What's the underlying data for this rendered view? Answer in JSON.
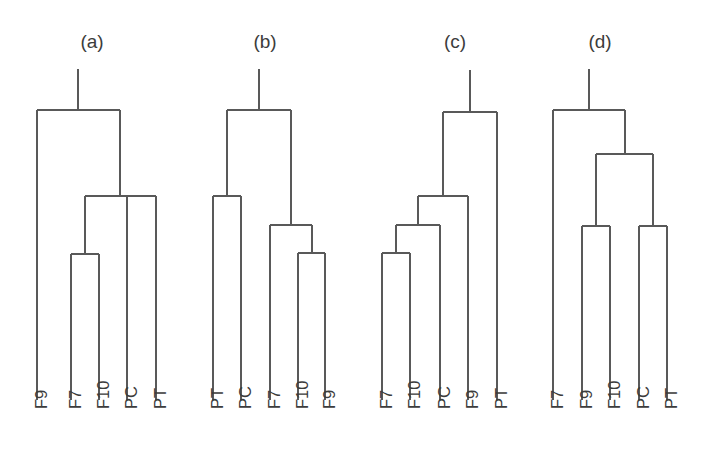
{
  "figure": {
    "background_color": "#ffffff",
    "line_color": "#595959",
    "text_color": "#3c3c3c",
    "width": 708,
    "height": 473
  },
  "panels": [
    {
      "id": "a",
      "title": "(a)",
      "title_x": 92,
      "title_y": 48,
      "leaves": [
        {
          "label": "F9",
          "x": 37
        },
        {
          "label": "F7",
          "x": 71
        },
        {
          "label": "F10",
          "x": 99
        },
        {
          "label": "PC",
          "x": 127
        },
        {
          "label": "PT",
          "x": 156
        }
      ],
      "merges": [
        {
          "name": "m1",
          "y": 254,
          "left": 71,
          "right": 99
        },
        {
          "name": "m2",
          "y": 196,
          "left": 85,
          "right": 156,
          "stubs": [
            127
          ]
        },
        {
          "name": "root",
          "y": 110,
          "left": 37,
          "right": 120
        }
      ],
      "root_stem": {
        "x": 78,
        "y_top": 69,
        "y_bottom": 110
      }
    },
    {
      "id": "b",
      "title": "(b)",
      "title_x": 265,
      "title_y": 48,
      "leaves": [
        {
          "label": "PT",
          "x": 213
        },
        {
          "label": "PC",
          "x": 241
        },
        {
          "label": "F7",
          "x": 270
        },
        {
          "label": "F10",
          "x": 298
        },
        {
          "label": "F9",
          "x": 325
        }
      ],
      "merges": [
        {
          "name": "m1",
          "y": 253,
          "left": 298,
          "right": 325
        },
        {
          "name": "m2",
          "y": 225,
          "left": 270,
          "right": 312
        },
        {
          "name": "m3",
          "y": 196,
          "left": 213,
          "right": 241
        },
        {
          "name": "root",
          "y": 110,
          "left": 227,
          "right": 291
        }
      ],
      "root_stem": {
        "x": 259,
        "y_top": 69,
        "y_bottom": 110
      }
    },
    {
      "id": "c",
      "title": "(c)",
      "title_x": 455,
      "title_y": 48,
      "leaves": [
        {
          "label": "F7",
          "x": 382
        },
        {
          "label": "F10",
          "x": 410
        },
        {
          "label": "PC",
          "x": 440
        },
        {
          "label": "F9",
          "x": 468
        },
        {
          "label": "PT",
          "x": 497
        }
      ],
      "merges": [
        {
          "name": "m1",
          "y": 253,
          "left": 382,
          "right": 410
        },
        {
          "name": "m2",
          "y": 225,
          "left": 396,
          "right": 440
        },
        {
          "name": "m3",
          "y": 196,
          "left": 418,
          "right": 468
        },
        {
          "name": "root",
          "y": 112,
          "left": 443,
          "right": 497
        }
      ],
      "root_stem": {
        "x": 470,
        "y_top": 70,
        "y_bottom": 112
      }
    },
    {
      "id": "d",
      "title": "(d)",
      "title_x": 600,
      "title_y": 48,
      "leaves": [
        {
          "label": "F7",
          "x": 553
        },
        {
          "label": "F9",
          "x": 582
        },
        {
          "label": "F10",
          "x": 610
        },
        {
          "label": "PC",
          "x": 639
        },
        {
          "label": "PT",
          "x": 667
        }
      ],
      "merges": [
        {
          "name": "m1",
          "y": 226,
          "left": 582,
          "right": 610
        },
        {
          "name": "m2",
          "y": 226,
          "left": 639,
          "right": 667
        },
        {
          "name": "m3",
          "y": 154,
          "left": 596,
          "right": 653
        },
        {
          "name": "root",
          "y": 110,
          "left": 553,
          "right": 625
        }
      ],
      "root_stem": {
        "x": 589,
        "y_top": 69,
        "y_bottom": 110
      }
    }
  ],
  "layout": {
    "leaf_baseline_y": 400,
    "label_start_y": 409,
    "label_rotation_deg": -90
  },
  "chart_data": {
    "type": "dendrogram-panels",
    "title": "",
    "panel_ids": [
      "a",
      "b",
      "c",
      "d"
    ],
    "taxa": [
      "F7",
      "F9",
      "F10",
      "PC",
      "PT"
    ],
    "topologies": {
      "a": "(F9,(( F7,F10),PC,PT))",
      "b": "((PT,PC),(F7,(F10,F9)))",
      "c": "((((F7,F10),PC),F9),PT)",
      "d": "(F7,((F9,F10),(PC,PT)))"
    },
    "leaf_orders": {
      "a": [
        "F9",
        "F7",
        "F10",
        "PC",
        "PT"
      ],
      "b": [
        "PT",
        "PC",
        "F7",
        "F10",
        "F9"
      ],
      "c": [
        "F7",
        "F10",
        "PC",
        "F9",
        "PT"
      ],
      "d": [
        "F7",
        "F9",
        "F10",
        "PC",
        "PT"
      ]
    },
    "merge_heights_px_from_top": {
      "a": [
        254,
        196,
        110
      ],
      "b": [
        253,
        225,
        196,
        110
      ],
      "c": [
        253,
        225,
        196,
        112
      ],
      "d": [
        226,
        226,
        154,
        110
      ]
    }
  }
}
